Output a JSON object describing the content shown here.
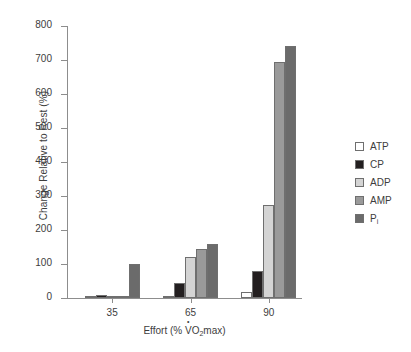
{
  "chart_data": {
    "type": "bar",
    "title": "",
    "xlabel": "Effort (% V̇O₂max)",
    "ylabel": "Change Relative to Rest (%)",
    "categories": [
      "35",
      "65",
      "90"
    ],
    "ylim": [
      0,
      800
    ],
    "yticks": [
      0,
      100,
      200,
      300,
      400,
      500,
      600,
      700,
      800
    ],
    "grid": false,
    "legend_position": "right",
    "series": [
      {
        "name": "ATP",
        "values": [
          5,
          6,
          18
        ],
        "color": "#ffffff"
      },
      {
        "name": "CP",
        "values": [
          9,
          45,
          79
        ],
        "color": "#231f20"
      },
      {
        "name": "ADP",
        "values": [
          3,
          120,
          273
        ],
        "color": "#d4d4d4"
      },
      {
        "name": "AMP",
        "values": [
          3,
          145,
          695
        ],
        "color": "#9a9a9a"
      },
      {
        "name": "Pi",
        "values": [
          99,
          158,
          741
        ],
        "color": "#6b6b6b"
      }
    ]
  },
  "axis": {
    "ylabel_text": "Change Relative to Rest (%)",
    "xlabel_prefix": "Effort (% ",
    "xlabel_v": "V",
    "xlabel_o": "O",
    "xlabel_sub2": "2",
    "xlabel_suffix": "max)",
    "yticks": [
      "800",
      "700",
      "600",
      "500",
      "400",
      "300",
      "200",
      "100",
      "0"
    ],
    "xticks": [
      "35",
      "65",
      "90"
    ]
  },
  "legend": {
    "items": [
      {
        "label": "ATP",
        "color": "#ffffff"
      },
      {
        "label": "CP",
        "color": "#231f20"
      },
      {
        "label": "ADP",
        "color": "#d4d4d4"
      },
      {
        "label": "AMP",
        "color": "#9a9a9a"
      },
      {
        "label": "Pi",
        "color": "#6b6b6b"
      }
    ]
  },
  "colors": {
    "axis": "#8d8d8d",
    "text": "#3d3d3d",
    "bar_border": "#6f6f6f",
    "background": "#ffffff"
  }
}
